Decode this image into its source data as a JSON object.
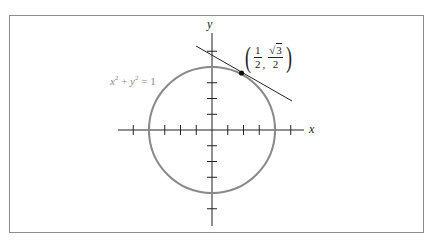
{
  "figure": {
    "axes": {
      "x_label": "x",
      "y_label": "y",
      "center_px": [
        212,
        130
      ],
      "tick_spacing_px": 15.75,
      "x_ticks": [
        -5,
        -4,
        -3,
        -2,
        -1,
        1,
        2,
        3,
        4,
        5
      ],
      "y_ticks": [
        -5,
        -4,
        -3,
        -2,
        -1,
        1,
        2,
        3,
        4,
        5
      ]
    },
    "circle": {
      "equation": "x² + y² = 1",
      "eq_lhs_x": "x",
      "eq_exp1": "2",
      "eq_plus": " + ",
      "eq_lhs_y": "y",
      "eq_exp2": "2",
      "eq_rhs": " = 1",
      "radius_units": 1,
      "color": "#8a8a8a"
    },
    "point": {
      "label": "(1/2, √3/2)",
      "x_num": "1",
      "x_den": "2",
      "y_num": "3",
      "y_den": "2",
      "sqrt_symbol": "√",
      "comma": ","
    },
    "tangent_line": {
      "description": "Tangent line to the unit circle at (1/2, √3/2)",
      "color": "#222222"
    }
  },
  "chart_data": {
    "type": "diagram",
    "title": "",
    "xlabel": "x",
    "ylabel": "y",
    "elements": [
      {
        "kind": "circle",
        "equation": "x^2 + y^2 = 1",
        "center": [
          0,
          0
        ],
        "radius": 1
      },
      {
        "kind": "point",
        "coords": [
          0.5,
          0.866
        ],
        "label": "(1/2, √3/2)"
      },
      {
        "kind": "line",
        "role": "tangent",
        "through": [
          0.5,
          0.866
        ],
        "slope": -0.577
      }
    ],
    "ticks_per_unit": 4,
    "grid": false
  }
}
